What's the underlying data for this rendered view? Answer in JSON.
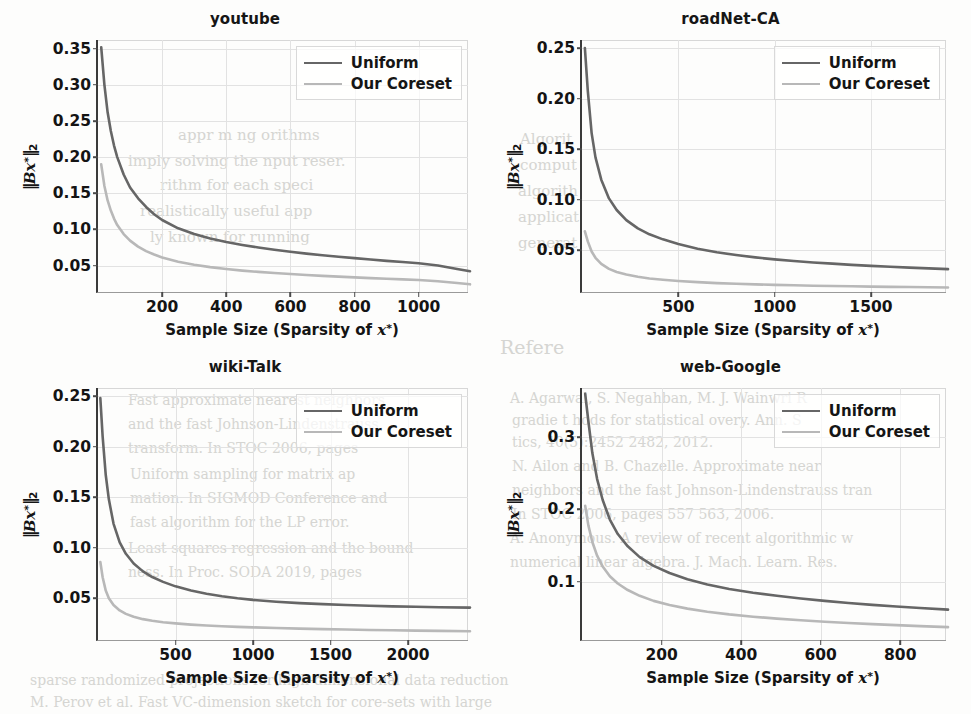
{
  "figure": {
    "panel_count": 4,
    "series_colors": {
      "uniform": "#666666",
      "coreset": "#b8b8b8"
    },
    "legend_labels": {
      "uniform": "Uniform",
      "coreset": "Our Coreset"
    },
    "axis_titles": {
      "x_prefix": "Sample Size (Sparsity of ",
      "x_var": "x",
      "x_var_sup": "*",
      "x_suffix": ")",
      "y_bar": "‖",
      "y_var": "Bx",
      "y_var_sup": "*",
      "y_sub": "2"
    }
  },
  "background_bleed": [
    {
      "text": "appr    m    ng   orithms",
      "x": 178,
      "y": 126,
      "size": 15
    },
    {
      "text": "imply solving the   nput   reser.",
      "x": 128,
      "y": 152,
      "size": 15
    },
    {
      "text": "rithm  for  each  speci",
      "x": 160,
      "y": 176,
      "size": 15
    },
    {
      "text": "realistically  useful   app",
      "x": 140,
      "y": 202,
      "size": 15
    },
    {
      "text": "ly  known  for  running",
      "x": 150,
      "y": 228,
      "size": 15
    },
    {
      "text": "Refere",
      "x": 500,
      "y": 336,
      "size": 19
    },
    {
      "text": "Algorit",
      "x": 520,
      "y": 130,
      "size": 15
    },
    {
      "text": "comput",
      "x": 520,
      "y": 156,
      "size": 15
    },
    {
      "text": "algorith",
      "x": 518,
      "y": 182,
      "size": 15
    },
    {
      "text": "applicat",
      "x": 518,
      "y": 208,
      "size": 15
    },
    {
      "text": "generat",
      "x": 518,
      "y": 234,
      "size": 15
    },
    {
      "text": "A.   Agarwal,  S.  Negahban,  M.  J.  Wainwri R",
      "x": 510,
      "y": 390,
      "size": 14
    },
    {
      "text": "gradie  t   hods  for  statistical   overy.  Ann.  S",
      "x": 512,
      "y": 412,
      "size": 14
    },
    {
      "text": "tics,  40(5):2452   2482,  2012.",
      "x": 512,
      "y": 434,
      "size": 14
    },
    {
      "text": "N.  Ailon   and   B.  Chazelle.   Approximate   near",
      "x": 512,
      "y": 458,
      "size": 14
    },
    {
      "text": "neighbors  and  the  fast  Johnson-Lindenstrauss  tran",
      "x": 512,
      "y": 482,
      "size": 14
    },
    {
      "text": "In  STOC  2006,  pages  557   563, 2006.",
      "x": 512,
      "y": 506,
      "size": 14
    },
    {
      "text": "A.  Anonymous.  A  review  of  recent  algorithmic  w",
      "x": 510,
      "y": 530,
      "size": 14
    },
    {
      "text": "numerical  linear  algebra.  J.  Mach.  Learn.  Res.",
      "x": 510,
      "y": 554,
      "size": 14
    },
    {
      "text": "Fast   approximate   nearest   neighbors",
      "x": 128,
      "y": 392,
      "size": 14
    },
    {
      "text": "and   the   fast   Johnson-Lindenstrauss",
      "x": 128,
      "y": 416,
      "size": 14
    },
    {
      "text": "transform.   In   STOC   2006,   pages",
      "x": 128,
      "y": 440,
      "size": 14
    },
    {
      "text": "Uniform    sampling    for    matrix    ap",
      "x": 130,
      "y": 466,
      "size": 14
    },
    {
      "text": "mation.   In   SIGMOD   Conference   and",
      "x": 130,
      "y": 490,
      "size": 14
    },
    {
      "text": "fast  algorithm  for  the  LP   error.",
      "x": 130,
      "y": 514,
      "size": 14
    },
    {
      "text": "Least   squares   regression   and   the   bound",
      "x": 128,
      "y": 540,
      "size": 14
    },
    {
      "text": "ness.    In    Proc.   SODA   2019,   pages",
      "x": 128,
      "y": 564,
      "size": 14
    },
    {
      "text": "sparse   randomized   projections   for   high-dimensional   data   reduction",
      "x": 30,
      "y": 672,
      "size": 14
    },
    {
      "text": "M. Perov  et  al.   Fast  VC-dimension  sketch  for   core-sets  with  large",
      "x": 30,
      "y": 694,
      "size": 14
    }
  ],
  "chart_data": [
    {
      "id": "youtube",
      "type": "line",
      "title": "youtube",
      "xlabel": "Sample Size (Sparsity of x*)",
      "ylabel": "||Bx*||_2",
      "xlim": [
        0,
        1160
      ],
      "ylim": [
        0.012,
        0.362
      ],
      "xticks": [
        200,
        400,
        600,
        800,
        1000
      ],
      "yticks": [
        0.05,
        0.1,
        0.15,
        0.2,
        0.25,
        0.3,
        0.35
      ],
      "ytick_labels": [
        "0.05",
        "0.10",
        "0.15",
        "0.20",
        "0.25",
        "0.30",
        "0.35"
      ],
      "xtick_labels": [
        "200",
        "400",
        "600",
        "800",
        "1000"
      ],
      "grid": true,
      "legend_position": "upper right",
      "series": [
        {
          "name": "Uniform",
          "color": "#666666",
          "x": [
            10,
            20,
            30,
            40,
            50,
            60,
            80,
            100,
            125,
            150,
            175,
            200,
            250,
            300,
            350,
            400,
            450,
            500,
            550,
            600,
            650,
            700,
            750,
            800,
            850,
            900,
            950,
            1000,
            1060,
            1120,
            1160
          ],
          "y": [
            0.352,
            0.3,
            0.262,
            0.236,
            0.216,
            0.2,
            0.176,
            0.158,
            0.143,
            0.131,
            0.121,
            0.113,
            0.1015,
            0.0935,
            0.0875,
            0.0825,
            0.0785,
            0.075,
            0.0718,
            0.069,
            0.0665,
            0.0643,
            0.0622,
            0.0602,
            0.0583,
            0.0565,
            0.0548,
            0.0531,
            0.05,
            0.0452,
            0.042
          ]
        },
        {
          "name": "Our Coreset",
          "color": "#b8b8b8",
          "x": [
            10,
            20,
            30,
            40,
            50,
            60,
            80,
            100,
            125,
            150,
            175,
            200,
            250,
            300,
            350,
            400,
            450,
            500,
            550,
            600,
            650,
            700,
            750,
            800,
            850,
            900,
            950,
            1000,
            1060,
            1120,
            1160
          ],
          "y": [
            0.19,
            0.16,
            0.14,
            0.126,
            0.115,
            0.106,
            0.0935,
            0.0845,
            0.0762,
            0.07,
            0.0652,
            0.0612,
            0.0552,
            0.051,
            0.0478,
            0.0452,
            0.043,
            0.0412,
            0.0396,
            0.0382,
            0.0369,
            0.0357,
            0.0346,
            0.0336,
            0.0326,
            0.0317,
            0.0308,
            0.0299,
            0.0282,
            0.0258,
            0.024
          ]
        }
      ]
    },
    {
      "id": "roadNet-CA",
      "type": "line",
      "title": "roadNet-CA",
      "xlabel": "Sample Size (Sparsity of x*)",
      "ylabel": "||Bx*||_2",
      "xlim": [
        0,
        1900
      ],
      "ylim": [
        0.008,
        0.258
      ],
      "xticks": [
        500,
        1000,
        1500
      ],
      "yticks": [
        0.05,
        0.1,
        0.15,
        0.2,
        0.25
      ],
      "ytick_labels": [
        "0.05",
        "0.10",
        "0.15",
        "0.20",
        "0.25"
      ],
      "xtick_labels": [
        "500",
        "1000",
        "1500"
      ],
      "grid": true,
      "legend_position": "upper right",
      "series": [
        {
          "name": "Uniform",
          "color": "#666666",
          "x": [
            15,
            30,
            50,
            70,
            100,
            140,
            180,
            230,
            290,
            350,
            420,
            500,
            600,
            700,
            800,
            900,
            1000,
            1100,
            1200,
            1300,
            1400,
            1500,
            1600,
            1700,
            1800,
            1900
          ],
          "y": [
            0.25,
            0.208,
            0.166,
            0.142,
            0.12,
            0.1015,
            0.09,
            0.08,
            0.0718,
            0.066,
            0.061,
            0.0565,
            0.0518,
            0.0482,
            0.0455,
            0.0432,
            0.0412,
            0.0396,
            0.0382,
            0.037,
            0.0358,
            0.0348,
            0.0339,
            0.0331,
            0.0323,
            0.0316
          ]
        },
        {
          "name": "Our Coreset",
          "color": "#b8b8b8",
          "x": [
            15,
            30,
            50,
            70,
            100,
            140,
            180,
            230,
            290,
            350,
            420,
            500,
            600,
            700,
            800,
            900,
            1000,
            1100,
            1200,
            1300,
            1400,
            1500,
            1600,
            1700,
            1800,
            1900
          ],
          "y": [
            0.069,
            0.059,
            0.049,
            0.0428,
            0.0368,
            0.0318,
            0.0288,
            0.0262,
            0.024,
            0.0224,
            0.0211,
            0.0199,
            0.0187,
            0.0178,
            0.0171,
            0.0165,
            0.016,
            0.0156,
            0.0152,
            0.0149,
            0.0146,
            0.0143,
            0.0141,
            0.0139,
            0.0137,
            0.0135
          ]
        }
      ]
    },
    {
      "id": "wiki-Talk",
      "type": "line",
      "title": "wiki-Talk",
      "xlabel": "Sample Size (Sparsity of x*)",
      "ylabel": "||Bx*||_2",
      "xlim": [
        0,
        2400
      ],
      "ylim": [
        0.008,
        0.258
      ],
      "xticks": [
        500,
        1000,
        1500,
        2000
      ],
      "yticks": [
        0.05,
        0.1,
        0.15,
        0.2,
        0.25
      ],
      "ytick_labels": [
        "0.05",
        "0.10",
        "0.15",
        "0.20",
        "0.25"
      ],
      "xtick_labels": [
        "500",
        "1000",
        "1500",
        "2000"
      ],
      "grid": true,
      "legend_position": "upper right",
      "series": [
        {
          "name": "Uniform",
          "color": "#666666",
          "x": [
            15,
            30,
            50,
            70,
            100,
            140,
            180,
            230,
            290,
            350,
            420,
            500,
            600,
            700,
            800,
            900,
            1000,
            1150,
            1300,
            1450,
            1600,
            1750,
            1900,
            2050,
            2200,
            2400
          ],
          "y": [
            0.248,
            0.21,
            0.172,
            0.148,
            0.124,
            0.1055,
            0.0942,
            0.0846,
            0.0768,
            0.0712,
            0.0664,
            0.062,
            0.0578,
            0.0546,
            0.0522,
            0.0502,
            0.0486,
            0.0468,
            0.0454,
            0.0444,
            0.0436,
            0.0428,
            0.0422,
            0.0418,
            0.0414,
            0.041
          ]
        },
        {
          "name": "Our Coreset",
          "color": "#b8b8b8",
          "x": [
            15,
            30,
            50,
            70,
            100,
            140,
            180,
            230,
            290,
            350,
            420,
            500,
            600,
            700,
            800,
            900,
            1000,
            1150,
            1300,
            1450,
            1600,
            1750,
            1900,
            2050,
            2200,
            2400
          ],
          "y": [
            0.086,
            0.071,
            0.0578,
            0.0502,
            0.0436,
            0.0382,
            0.0348,
            0.032,
            0.0296,
            0.028,
            0.0266,
            0.0254,
            0.0242,
            0.0233,
            0.0226,
            0.022,
            0.0215,
            0.0208,
            0.0202,
            0.0197,
            0.0193,
            0.0189,
            0.0186,
            0.0183,
            0.018,
            0.0176
          ]
        }
      ]
    },
    {
      "id": "web-Google",
      "type": "line",
      "title": "web-Google",
      "xlabel": "Sample Size (Sparsity of x*)",
      "ylabel": "||Bx*||_2",
      "xlim": [
        0,
        920
      ],
      "ylim": [
        0.018,
        0.368
      ],
      "xticks": [
        200,
        400,
        600,
        800
      ],
      "yticks": [
        0.1,
        0.2,
        0.3
      ],
      "ytick_labels": [
        "0.1",
        "0.2",
        "0.3"
      ],
      "xtick_labels": [
        "200",
        "400",
        "600",
        "800"
      ],
      "grid": true,
      "legend_position": "upper right",
      "series": [
        {
          "name": "Uniform",
          "color": "#666666",
          "x": [
            8,
            16,
            26,
            38,
            52,
            70,
            90,
            115,
            145,
            180,
            220,
            265,
            315,
            370,
            430,
            490,
            550,
            610,
            670,
            730,
            790,
            850,
            920
          ],
          "y": [
            0.36,
            0.322,
            0.278,
            0.242,
            0.213,
            0.186,
            0.166,
            0.149,
            0.134,
            0.122,
            0.112,
            0.1035,
            0.0962,
            0.09,
            0.0848,
            0.0805,
            0.0768,
            0.0735,
            0.0706,
            0.068,
            0.0657,
            0.0636,
            0.0614
          ]
        },
        {
          "name": "Our Coreset",
          "color": "#b8b8b8",
          "x": [
            8,
            16,
            26,
            38,
            52,
            70,
            90,
            115,
            145,
            180,
            220,
            265,
            315,
            370,
            430,
            490,
            550,
            610,
            670,
            730,
            790,
            850,
            920
          ],
          "y": [
            0.205,
            0.178,
            0.155,
            0.136,
            0.121,
            0.1075,
            0.0975,
            0.0885,
            0.0805,
            0.0735,
            0.0678,
            0.0628,
            0.0585,
            0.0548,
            0.0516,
            0.049,
            0.0467,
            0.0447,
            0.0429,
            0.0413,
            0.0399,
            0.0386,
            0.0372
          ]
        }
      ]
    }
  ]
}
